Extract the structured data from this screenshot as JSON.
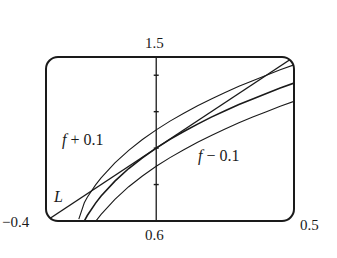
{
  "chart_data": {
    "type": "line",
    "title": "",
    "xlabel": "",
    "ylabel": "",
    "xlim": [
      -0.4,
      0.5
    ],
    "ylim": [
      0.6,
      1.5
    ],
    "grid": false,
    "frame": "rounded-box",
    "y_axis_at_x": 0,
    "y_ticks": [
      0.8,
      1.0,
      1.2,
      1.4
    ],
    "labels": {
      "x_min": "−0.4",
      "x_max": "0.5",
      "y_min": "0.6",
      "y_max": "1.5"
    },
    "annotations": [
      {
        "text_italic": "f",
        "text": " + 0.1",
        "series": "f_plus"
      },
      {
        "text_italic": "f",
        "text": " − 0.1",
        "series": "f_minus"
      },
      {
        "text_italic": "L",
        "text": "",
        "series": "L"
      }
    ],
    "series": [
      {
        "name": "f",
        "x": [
          -0.261,
          -0.25,
          -0.22,
          -0.2,
          -0.15,
          -0.1,
          -0.05,
          0,
          0.05,
          0.1,
          0.15,
          0.2,
          0.25,
          0.3,
          0.35,
          0.4,
          0.45,
          0.5
        ],
        "values": [
          0.6,
          0.63,
          0.698,
          0.737,
          0.819,
          0.888,
          0.947,
          1.0,
          1.048,
          1.091,
          1.132,
          1.17,
          1.205,
          1.239,
          1.27,
          1.3,
          1.33,
          1.357
        ]
      },
      {
        "name": "f + 0.1",
        "offset_of": "f",
        "offset": 0.1
      },
      {
        "name": "f − 0.1",
        "offset_of": "f",
        "offset": -0.1
      },
      {
        "name": "L",
        "x": [
          -0.4,
          0.5
        ],
        "values": [
          0.6,
          1.5
        ]
      }
    ]
  },
  "colors": {
    "ink": "#1a1a1a",
    "background": "#ffffff"
  }
}
